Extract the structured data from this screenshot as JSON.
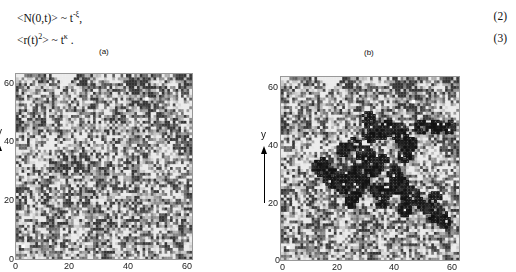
{
  "equations": [
    {
      "lhs": "<N(0,t)> ~ t",
      "exp": "-ξ",
      "tail": ",",
      "number": "(2)"
    },
    {
      "lhs": "<r(t)",
      "sq": "2",
      "mid": "> ~ t",
      "exp": "κ",
      "tail": " .",
      "number": "(3)"
    }
  ],
  "panels": [
    {
      "label": "(a)",
      "ylabel": "y",
      "x_ticks": [
        "0",
        "20",
        "40",
        "60"
      ],
      "y_ticks": [
        "0",
        "20",
        "40",
        "60"
      ],
      "show_cluster": false
    },
    {
      "label": "(b)",
      "ylabel": "y",
      "x_ticks": [
        "0",
        "20",
        "40",
        "60"
      ],
      "y_ticks": [
        "20",
        "40",
        "60"
      ],
      "show_cluster": true
    }
  ],
  "chart_data": [
    {
      "type": "heatmap",
      "title": "(a)",
      "xlabel": "",
      "ylabel": "y",
      "xlim": [
        0,
        64
      ],
      "ylim": [
        0,
        64
      ],
      "grid_size": 64,
      "description": "Grayscale random-field lattice (64x64), light and dark mottled regions; white markers near (2,4) and (47,55)",
      "markers": [
        [
          2,
          4
        ],
        [
          47,
          55
        ]
      ]
    },
    {
      "type": "heatmap",
      "title": "(b)",
      "xlabel": "",
      "ylabel": "y",
      "xlim": [
        0,
        64
      ],
      "ylim": [
        0,
        64
      ],
      "grid_size": 64,
      "description": "Same lattice with visited-site cluster overlaid as dark outlined squares",
      "markers": [
        [
          2,
          4
        ],
        [
          47,
          55
        ]
      ],
      "cluster_blobs": [
        [
          14,
          32,
          3
        ],
        [
          18,
          28,
          3
        ],
        [
          22,
          26,
          3
        ],
        [
          26,
          24,
          3
        ],
        [
          27,
          30,
          3
        ],
        [
          25,
          20,
          2
        ],
        [
          30,
          36,
          3
        ],
        [
          32,
          44,
          3
        ],
        [
          31,
          49,
          2
        ],
        [
          36,
          44,
          2
        ],
        [
          38,
          46,
          2
        ],
        [
          42,
          44,
          3
        ],
        [
          45,
          40,
          3
        ],
        [
          44,
          36,
          2
        ],
        [
          50,
          46,
          2
        ],
        [
          55,
          46,
          2
        ],
        [
          60,
          46,
          2
        ],
        [
          22,
          38,
          2
        ],
        [
          26,
          40,
          2
        ],
        [
          36,
          34,
          2
        ],
        [
          40,
          30,
          2
        ],
        [
          42,
          26,
          3
        ],
        [
          46,
          22,
          3
        ],
        [
          48,
          20,
          2
        ],
        [
          38,
          24,
          2
        ],
        [
          34,
          24,
          2
        ],
        [
          36,
          20,
          2
        ],
        [
          44,
          17,
          2
        ],
        [
          52,
          18,
          2
        ],
        [
          56,
          15,
          3
        ],
        [
          58,
          13,
          2
        ],
        [
          55,
          21,
          2
        ],
        [
          33,
          32,
          3
        ],
        [
          29,
          27,
          2
        ]
      ]
    }
  ]
}
